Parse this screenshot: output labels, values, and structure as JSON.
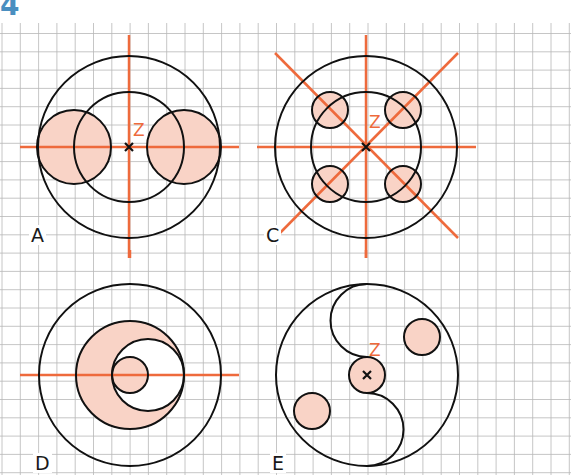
{
  "exercise_number": "4",
  "colors": {
    "grid": "#b8b8b8",
    "axis": "#ee6a3c",
    "stroke": "#111111",
    "fill": "#f9d3c6",
    "number": "#4a8fc0"
  },
  "center_label": "Z",
  "figures": [
    {
      "id": "A",
      "label": "A"
    },
    {
      "id": "C",
      "label": "C"
    },
    {
      "id": "D",
      "label": "D"
    },
    {
      "id": "E",
      "label": "E"
    }
  ]
}
